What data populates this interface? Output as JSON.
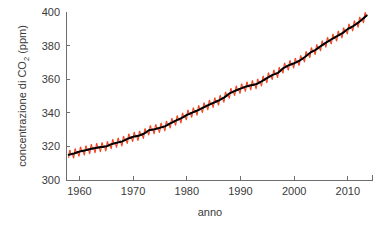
{
  "figure": {
    "background_color": "#ffffff",
    "axis_color": "#6e6e6e",
    "text_color": "#3a3a3a"
  },
  "chart_data": {
    "type": "line",
    "title": "",
    "xlabel": "anno",
    "ylabel_prefix": "concentrazione di CO",
    "ylabel_subscript": "2",
    "ylabel_suffix": " (ppm)",
    "ylabel_full": "concentrazione di CO2 (ppm)",
    "xlim": [
      1957.5,
      2014.5
    ],
    "ylim": [
      300,
      400
    ],
    "xticks": [
      1960,
      1970,
      1980,
      1990,
      2000,
      2010
    ],
    "xticklabels": [
      "1960",
      "1970",
      "1980",
      "1990",
      "2000",
      "2010"
    ],
    "yticks": [
      300,
      320,
      340,
      360,
      380,
      400
    ],
    "yticklabels": [
      "300",
      "320",
      "340",
      "360",
      "380",
      "400"
    ],
    "grid": false,
    "legend": "none",
    "series": [
      {
        "name": "misure mensili",
        "color": "#ef4a28",
        "linewidth": 1.1,
        "description": "serie mensile con oscillazione stagionale a dente di sega",
        "seasonal_amplitude_ppm": 3.0
      },
      {
        "name": "media mobile annuale",
        "color": "#000000",
        "linewidth": 2.0,
        "description": "andamento medio annuale liscio",
        "x": [
          1958,
          1959,
          1960,
          1961,
          1962,
          1963,
          1964,
          1965,
          1966,
          1967,
          1968,
          1969,
          1970,
          1971,
          1972,
          1973,
          1974,
          1975,
          1976,
          1977,
          1978,
          1979,
          1980,
          1981,
          1982,
          1983,
          1984,
          1985,
          1986,
          1987,
          1988,
          1989,
          1990,
          1991,
          1992,
          1993,
          1994,
          1995,
          1996,
          1997,
          1998,
          1999,
          2000,
          2001,
          2002,
          2003,
          2004,
          2005,
          2006,
          2007,
          2008,
          2009,
          2010,
          2011,
          2012,
          2013
        ],
        "values": [
          315.0,
          315.8,
          316.9,
          317.6,
          318.4,
          319.0,
          319.6,
          320.0,
          321.4,
          322.2,
          323.0,
          324.6,
          325.7,
          326.3,
          327.5,
          329.7,
          330.2,
          331.1,
          332.0,
          333.8,
          335.4,
          336.8,
          338.7,
          340.1,
          341.4,
          343.0,
          344.6,
          346.0,
          347.4,
          349.2,
          351.6,
          353.1,
          354.4,
          355.6,
          356.4,
          357.1,
          358.8,
          360.8,
          362.6,
          363.8,
          366.6,
          368.3,
          369.5,
          371.0,
          373.2,
          375.8,
          377.5,
          379.8,
          381.9,
          383.8,
          385.6,
          387.4,
          389.9,
          391.6,
          393.8,
          396.5
        ]
      }
    ]
  }
}
